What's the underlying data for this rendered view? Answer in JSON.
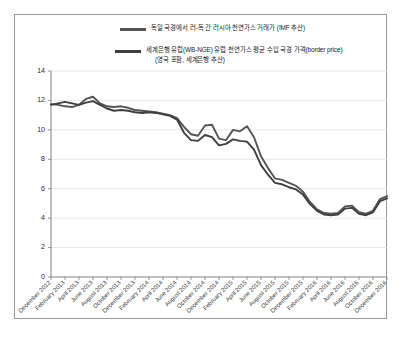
{
  "figure": {
    "background_color": "#ffffff",
    "border_color": "#9a9a9a"
  },
  "legend": {
    "position": "top-center",
    "entries": [
      {
        "name": "series-imf",
        "color": "#555555",
        "label": "독일 국경에서 러-독 간 러시아 천연가스 거래가 (IMF 추산)",
        "label_line2": ""
      },
      {
        "name": "series-worldbank",
        "color": "#3f3f3f",
        "label": "세계은행 유럽(WB-NGE) 유럽 천연가스 평균 수입 국경 가격(border price)",
        "label_line2": "(영국 포함, 세계은행 추산)"
      }
    ]
  },
  "chart_data": {
    "type": "line",
    "title": "",
    "subtitle": "",
    "xlabel": "",
    "ylabel": "",
    "grid": true,
    "legend_position": "top-center",
    "ylim": [
      0,
      14
    ],
    "yticks": [
      0,
      2,
      4,
      6,
      8,
      10,
      12,
      14
    ],
    "ytick_labels": [
      "0",
      "2",
      "4",
      "6",
      "8",
      "10",
      "12",
      "14"
    ],
    "categories": [
      "December 2012",
      "February 2013",
      "April 2013",
      "June 2013",
      "August 2013",
      "October 2013",
      "December 2013",
      "February 2014",
      "April 2014",
      "June 2014",
      "August 2014",
      "October 2014",
      "December 2014",
      "February 2015",
      "April 2015",
      "June 2015",
      "August 2015",
      "October 2015",
      "December 2015",
      "February 2016",
      "April 2016",
      "June 2016",
      "August 2016",
      "October 2016",
      "December 2016"
    ],
    "x_minor_count": 4,
    "series": [
      {
        "name": "독일 국경에서 러-독 간 러시아 천연가스 거래가 (IMF 추산)",
        "short_name": "imf-russian-gas-german-border",
        "color": "#555555",
        "values": [
          11.75,
          11.85,
          11.6,
          11.7,
          12.25,
          11.75,
          11.55,
          11.6,
          11.3,
          11.25,
          11.1,
          10.9,
          10.2,
          9.65,
          10.2,
          10.35,
          9.35,
          9.9,
          10.2,
          9.5,
          8.1,
          7.3,
          6.7,
          6.5,
          6.3
        ],
        "values_detail": [
          11.75,
          11.7,
          11.6,
          11.55,
          11.7,
          12.1,
          12.25,
          11.8,
          11.6,
          11.55,
          11.6,
          11.5,
          11.35,
          11.3,
          11.25,
          11.2,
          11.1,
          11.0,
          10.8,
          10.2,
          9.7,
          9.6,
          10.3,
          10.35,
          9.4,
          9.3,
          10.0,
          9.9,
          10.25,
          9.5,
          8.2,
          7.4,
          6.7,
          6.6,
          6.4,
          6.2,
          5.8,
          5.1,
          4.6,
          4.35,
          4.3,
          4.35,
          4.8,
          4.85,
          4.4,
          4.3,
          4.5,
          5.3,
          5.5
        ]
      },
      {
        "name": "세계은행 유럽(WB-NGE) 유럽 천연가스 평균 수입 국경 가격(border price)",
        "short_name": "worldbank-europe-border-price",
        "color": "#3f3f3f",
        "values": [
          11.7,
          11.9,
          11.65,
          11.6,
          11.95,
          11.5,
          11.3,
          11.25,
          11.15,
          11.2,
          11.1,
          10.8,
          9.8,
          9.3,
          9.6,
          9.55,
          9.0,
          9.3,
          9.2,
          8.6,
          7.5,
          6.9,
          6.4,
          6.2,
          6.0
        ],
        "values_detail": [
          11.7,
          11.8,
          11.9,
          11.8,
          11.7,
          11.85,
          11.95,
          11.7,
          11.45,
          11.3,
          11.35,
          11.3,
          11.2,
          11.15,
          11.2,
          11.15,
          11.05,
          10.95,
          10.7,
          9.8,
          9.3,
          9.25,
          9.65,
          9.5,
          8.95,
          9.05,
          9.35,
          9.25,
          9.2,
          8.65,
          7.6,
          6.95,
          6.4,
          6.3,
          6.1,
          5.95,
          5.6,
          4.95,
          4.5,
          4.25,
          4.2,
          4.25,
          4.65,
          4.7,
          4.3,
          4.2,
          4.4,
          5.15,
          5.35
        ]
      }
    ]
  }
}
